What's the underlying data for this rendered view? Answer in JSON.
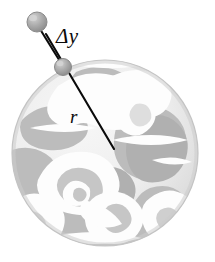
{
  "figure": {
    "kind": "physics-diagram",
    "background_color": "#ffffff",
    "width": 215,
    "height": 262
  },
  "labels": {
    "displacement": "Δy",
    "radius": "r"
  },
  "planet": {
    "name": "planet-globe",
    "center_x": 105,
    "center_y": 153,
    "radius": 93,
    "ocean_color": "#e9e9e9",
    "land_color": "#b9b9b9",
    "cloud_color": "#fdfdfd",
    "outline_color": "#c9c9c9",
    "shadow_color": "#d0d0d0"
  },
  "balls": [
    {
      "name": "ball-upper",
      "center_x": 37,
      "center_y": 22,
      "radius": 10,
      "fill_color": "#a9a9a9",
      "edge_color": "#8a8a8a",
      "highlight_color": "#cfcfcf"
    },
    {
      "name": "ball-lower",
      "center_x": 63,
      "center_y": 67,
      "radius": 8.5,
      "fill_color": "#a9a9a9",
      "edge_color": "#8a8a8a",
      "highlight_color": "#cfcfcf"
    }
  ],
  "arrows": {
    "displacement_arrow": {
      "name": "displacement-arrow",
      "x1": 33,
      "y1": 19,
      "x2": 68,
      "y2": 74,
      "double_headed": true,
      "color": "#0a0a0a",
      "width": 2.1
    },
    "radius_line": {
      "name": "radius-line",
      "x1": 46,
      "y1": 34,
      "x2": 114,
      "y2": 149,
      "color": "#0a0a0a",
      "width": 2.1
    }
  },
  "colors": {
    "ink": "#0a0a0a",
    "paper": "#ffffff",
    "gray_mid": "#b9b9b9",
    "gray_light": "#e9e9e9"
  }
}
